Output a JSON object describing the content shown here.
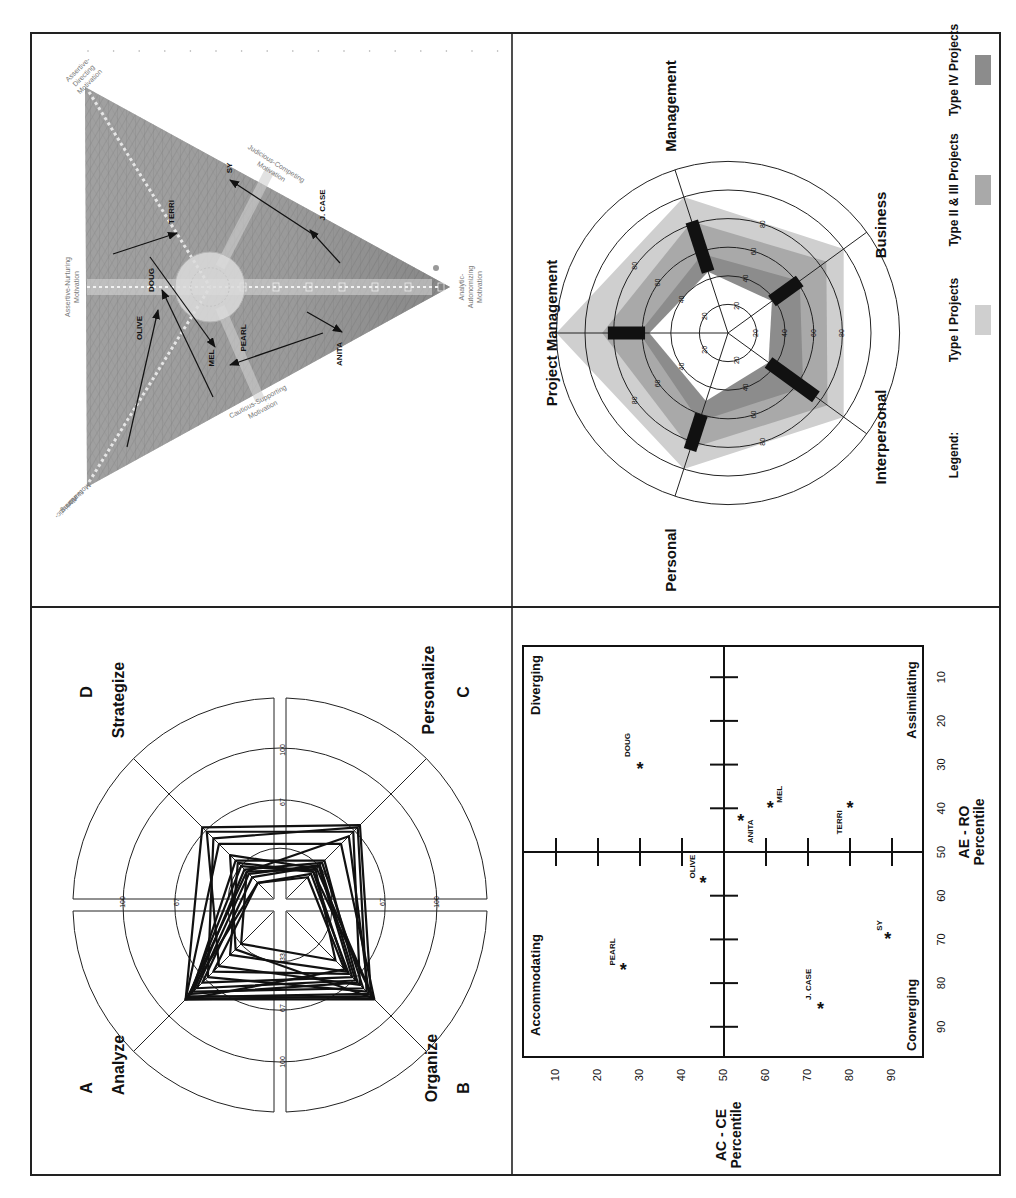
{
  "figure": {
    "orientation": "rotated 90deg counter-clockwise",
    "panels": [
      "top-left",
      "top-right",
      "bottom-left",
      "bottom-right"
    ]
  },
  "chart_data": [
    {
      "id": "triangle",
      "type": "diagram",
      "title": "",
      "vertices": [
        {
          "label": "Assertive-Directing Motivation",
          "x": 85,
          "y": 87
        },
        {
          "label": "Altruistic-Nurturing Motivation",
          "x": 87,
          "y": 487
        },
        {
          "label": "Analytic-Autonomizing Motivation",
          "x": 450,
          "y": 287
        }
      ],
      "edge_labels": [
        {
          "label": "Assertive-Nurturing Motivation",
          "line1": "Assertive-Nurturing",
          "line2": "Motivation",
          "x": 70,
          "y": 287
        },
        {
          "label": "Judicious-Competing Motivation",
          "line1": "Judicious-Competing",
          "line2": "Motivation",
          "x": 275,
          "y": 168,
          "rot": 152
        },
        {
          "label": "Cautious-Supporting Motivation",
          "line1": "Cautious-Supporting",
          "line2": "Motivation",
          "x": 262,
          "y": 400,
          "rot": -28
        }
      ],
      "center_circle": {
        "x": 210,
        "y": 287,
        "r": 35
      },
      "arrows": [
        {
          "name": "TERRI",
          "from": [
            113,
            254
          ],
          "to": [
            177,
            233
          ],
          "label_pos": [
            172,
            212
          ]
        },
        {
          "name": "SY",
          "from": [
            317,
            237
          ],
          "to": [
            230,
            180
          ],
          "label_pos": [
            230,
            168
          ]
        },
        {
          "name": "J. CASE",
          "from": [
            340,
            263
          ],
          "to": [
            310,
            230
          ],
          "label_pos": [
            323,
            205
          ]
        },
        {
          "name": "DOUG",
          "from": [
            213,
            397
          ],
          "to": [
            162,
            290
          ],
          "label_pos": [
            152,
            280
          ]
        },
        {
          "name": "OLIVE",
          "from": [
            127,
            447
          ],
          "to": [
            158,
            310
          ],
          "label_pos": [
            140,
            328
          ]
        },
        {
          "name": "MEL",
          "from": [
            150,
            257
          ],
          "to": [
            215,
            347
          ],
          "label_pos": [
            212,
            358
          ]
        },
        {
          "name": "PEARL",
          "from": [
            323,
            333
          ],
          "to": [
            230,
            365
          ],
          "label_pos": [
            244,
            338
          ]
        },
        {
          "name": "ANITA",
          "from": [
            307,
            312
          ],
          "to": [
            342,
            332
          ],
          "label_pos": [
            340,
            354
          ]
        }
      ]
    },
    {
      "id": "pentagon-radar",
      "type": "radar",
      "title": "",
      "axes": [
        "Project Management",
        "Management",
        "Business",
        "Interpersonal",
        "Personal"
      ],
      "ring_ticks": [
        20,
        40,
        60,
        80
      ],
      "rmax": 120,
      "series": [
        {
          "name": "Type I Projects",
          "color": "#cfcfcf",
          "values": [
            120,
            100,
            100,
            100,
            100
          ]
        },
        {
          "name": "Type II & III Projects",
          "color": "#a9a9a9",
          "values": [
            88,
            82,
            85,
            86,
            85
          ]
        },
        {
          "name": "Type IV Projects",
          "color": "#8c8c8c",
          "values": [
            62,
            58,
            62,
            65,
            65
          ]
        },
        {
          "name": "inner-white",
          "color": "#ffffff",
          "values": [
            55,
            45,
            38,
            35,
            50
          ]
        }
      ],
      "range_bars": [
        {
          "axis": "Project Management",
          "from": 58,
          "to": 84
        },
        {
          "axis": "Management",
          "from": 45,
          "to": 82
        },
        {
          "axis": "Business",
          "from": 38,
          "to": 62
        },
        {
          "axis": "Interpersonal",
          "from": 35,
          "to": 76
        },
        {
          "axis": "Personal",
          "from": 60,
          "to": 86
        }
      ],
      "legend": {
        "title": "Legend:",
        "items": [
          {
            "label": "Type I Projects",
            "color": "#cfcfcf"
          },
          {
            "label": "Type II & III Projects",
            "color": "#a9a9a9"
          },
          {
            "label": "Type IV Projects",
            "color": "#8c8c8c"
          }
        ],
        "position": "right (rotated, along bottom of panel)"
      }
    },
    {
      "id": "abcd-radar",
      "type": "radar",
      "title": "",
      "quadrant_labels": [
        {
          "letter": "A",
          "name": "Analyze"
        },
        {
          "letter": "B",
          "name": "Organize"
        },
        {
          "letter": "C",
          "name": "Personalize"
        },
        {
          "letter": "D",
          "name": "Strategize"
        }
      ],
      "ring_ticks": [
        33,
        67,
        100
      ],
      "tick_labels_up": [
        "100",
        "67"
      ],
      "tick_labels_down": [
        "33",
        "67",
        "100"
      ],
      "tick_labels_left": [
        "100",
        "67",
        "33"
      ],
      "tick_labels_right": [
        "67",
        "100"
      ],
      "rmax": 133,
      "series_note": "approx. 20 overlapping individual profiles",
      "series": [
        {
          "name": "profile-1",
          "values": {
            "A": 85,
            "B": 85,
            "C": 55,
            "D": 55
          }
        },
        {
          "name": "profile-2",
          "values": {
            "A": 85,
            "B": 82,
            "C": 72,
            "D": 70
          }
        },
        {
          "name": "profile-3",
          "values": {
            "A": 83,
            "B": 80,
            "C": 62,
            "D": 30
          }
        },
        {
          "name": "profile-4",
          "values": {
            "A": 80,
            "B": 70,
            "C": 40,
            "D": 40
          }
        },
        {
          "name": "profile-5",
          "values": {
            "A": 78,
            "B": 75,
            "C": 38,
            "D": 32
          }
        },
        {
          "name": "profile-6",
          "values": {
            "A": 75,
            "B": 68,
            "C": 36,
            "D": 28
          }
        },
        {
          "name": "profile-7",
          "values": {
            "A": 70,
            "B": 65,
            "C": 35,
            "D": 25
          }
        },
        {
          "name": "profile-8",
          "values": {
            "A": 65,
            "B": 78,
            "C": 70,
            "D": 60
          }
        },
        {
          "name": "profile-9",
          "values": {
            "A": 60,
            "B": 62,
            "C": 28,
            "D": 20
          }
        },
        {
          "name": "profile-10",
          "values": {
            "A": 55,
            "B": 72,
            "C": 66,
            "D": 66
          }
        },
        {
          "name": "profile-11",
          "values": {
            "A": 45,
            "B": 60,
            "C": 30,
            "D": 38
          }
        },
        {
          "name": "profile-12",
          "values": {
            "A": 85,
            "B": 58,
            "C": 25,
            "D": 20
          }
        },
        {
          "name": "profile-13",
          "values": {
            "A": 40,
            "B": 84,
            "C": 33,
            "D": 45
          }
        },
        {
          "name": "profile-14",
          "values": {
            "A": 82,
            "B": 84,
            "C": 30,
            "D": 35
          }
        },
        {
          "name": "profile-15",
          "values": {
            "A": 35,
            "B": 50,
            "C": 32,
            "D": 30
          }
        }
      ]
    },
    {
      "id": "lsi-scatter",
      "type": "scatter",
      "title": "",
      "xlabel": "AC - CE Percentile",
      "ylabel": "AE - RO Percentile",
      "x_ticks": [
        10,
        20,
        30,
        40,
        50,
        60,
        70,
        80,
        90
      ],
      "y_ticks": [
        10,
        20,
        30,
        40,
        50,
        60,
        70,
        80,
        90
      ],
      "xlim": [
        0,
        97
      ],
      "ylim": [
        0,
        97
      ],
      "quadrant_labels": {
        "top_left": "Diverging",
        "top_right": "Assimilating",
        "bottom_left": "Accommodating",
        "bottom_right": "Converging"
      },
      "points": [
        {
          "name": "DOUG",
          "x": 30,
          "y": 31
        },
        {
          "name": "MEL",
          "x": 61,
          "y": 40
        },
        {
          "name": "ANITA",
          "x": 54,
          "y": 43
        },
        {
          "name": "TERRI",
          "x": 80,
          "y": 40
        },
        {
          "name": "OLIVE",
          "x": 45,
          "y": 57
        },
        {
          "name": "PEARL",
          "x": 26,
          "y": 77
        },
        {
          "name": "SY",
          "x": 89,
          "y": 70
        },
        {
          "name": "J. CASE",
          "x": 73,
          "y": 86
        }
      ],
      "marker": "*"
    }
  ]
}
